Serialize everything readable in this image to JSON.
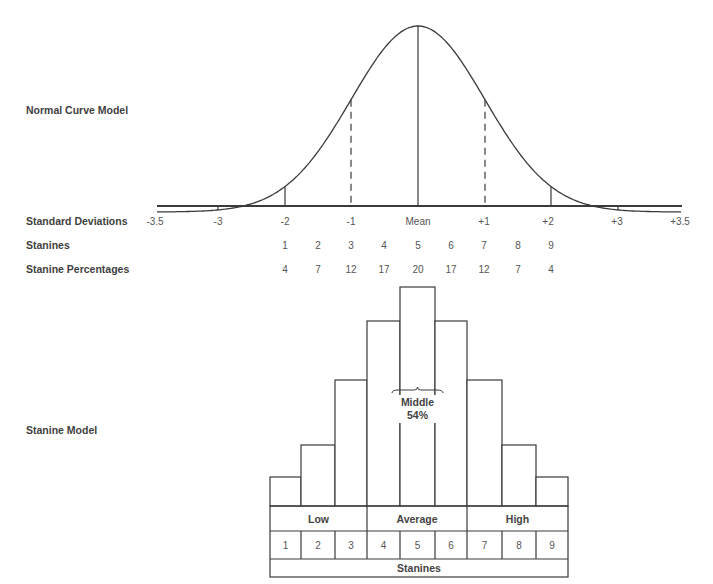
{
  "labels": {
    "normal_curve_model": "Normal Curve Model",
    "standard_deviations": "Standard Deviations",
    "stanines": "Stanines",
    "stanine_percentages": "Stanine Percentages",
    "stanine_model": "Stanine Model"
  },
  "colors": {
    "line": "#3a3a3a",
    "text": "#3f3f3f",
    "background": "#ffffff"
  },
  "curve": {
    "mean_x": 418,
    "peak_y": 26,
    "baseline_y": 206,
    "x_start": 157,
    "x_end": 682,
    "sd_px": 66.7,
    "dividers": [
      {
        "name": "minus-3",
        "x": 218,
        "dashed": false
      },
      {
        "name": "minus-2",
        "x": 285,
        "dashed": false
      },
      {
        "name": "minus-1",
        "x": 351,
        "dashed": true
      },
      {
        "name": "mean",
        "x": 418,
        "dashed": false
      },
      {
        "name": "plus-1",
        "x": 485,
        "dashed": true
      },
      {
        "name": "plus-2",
        "x": 551,
        "dashed": false
      },
      {
        "name": "plus-3",
        "x": 618,
        "dashed": false
      }
    ]
  },
  "standard_deviations": [
    {
      "label": "-3.5",
      "x": 155
    },
    {
      "label": "-3",
      "x": 218
    },
    {
      "label": "-2",
      "x": 285
    },
    {
      "label": "-1",
      "x": 351
    },
    {
      "label": "Mean",
      "x": 418
    },
    {
      "label": "+1",
      "x": 484
    },
    {
      "label": "+2",
      "x": 548
    },
    {
      "label": "+3",
      "x": 617
    },
    {
      "label": "+3.5",
      "x": 680
    }
  ],
  "stanine_columns_x": [
    285,
    318,
    351,
    384,
    418,
    451,
    484,
    518,
    551
  ],
  "stanines": [
    "1",
    "2",
    "3",
    "4",
    "5",
    "6",
    "7",
    "8",
    "9"
  ],
  "stanine_percentages": [
    "4",
    "7",
    "12",
    "17",
    "20",
    "17",
    "12",
    "7",
    "4"
  ],
  "stanine_model": {
    "column_edges": [
      270,
      301,
      335,
      367,
      400,
      435,
      467,
      502,
      536,
      568
    ],
    "bar_tops": [
      477,
      445,
      380,
      321,
      287,
      321,
      380,
      445,
      477
    ],
    "bar_base_y": 506,
    "band_row_bottom": 531,
    "number_row_bottom": 559,
    "footer_bottom": 577,
    "bands": [
      {
        "label": "Low",
        "from": 0,
        "to": 3
      },
      {
        "label": "Average",
        "from": 3,
        "to": 6
      },
      {
        "label": "High",
        "from": 6,
        "to": 9
      }
    ],
    "footer_label": "Stanines",
    "middle": {
      "label": "Middle",
      "percent": "54%",
      "brace_x1": 392,
      "brace_x2": 443,
      "brace_y": 390
    }
  },
  "chart_data": {
    "type": "bar",
    "categories": [
      "1",
      "2",
      "3",
      "4",
      "5",
      "6",
      "7",
      "8",
      "9"
    ],
    "values": [
      4,
      7,
      12,
      17,
      20,
      17,
      12,
      7,
      4
    ],
    "xlabel": "Stanines",
    "ylabel": "Stanine Percentages",
    "groups": [
      {
        "label": "Low",
        "stanines": [
          1,
          2,
          3
        ]
      },
      {
        "label": "Average",
        "stanines": [
          4,
          5,
          6
        ]
      },
      {
        "label": "High",
        "stanines": [
          7,
          8,
          9
        ]
      }
    ],
    "annotation": "Middle 54%",
    "standard_deviation_ticks": [
      "-3.5",
      "-3",
      "-2",
      "-1",
      "Mean",
      "+1",
      "+2",
      "+3",
      "+3.5"
    ]
  }
}
